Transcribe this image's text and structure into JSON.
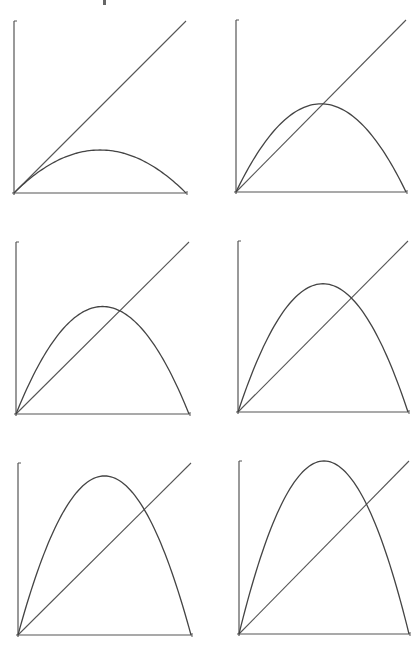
{
  "chart_data": [
    {
      "type": "line",
      "title": "",
      "description": "Parabola y = r·x·(1−x) vs identity line y = x",
      "r": 1.0,
      "xlim": [
        0,
        1
      ],
      "ylim": [
        0,
        1
      ],
      "grid": false,
      "series": [
        {
          "name": "parabola",
          "x": [
            0,
            0.25,
            0.5,
            0.75,
            1
          ],
          "values": [
            0,
            0.19,
            0.25,
            0.19,
            0
          ]
        },
        {
          "name": "identity",
          "x": [
            0,
            1
          ],
          "values": [
            0,
            1
          ]
        }
      ],
      "frame": {
        "x0": 14,
        "y0": 193,
        "x1": 186,
        "y1": 21
      }
    },
    {
      "type": "line",
      "title": "",
      "description": "Parabola y = r·x·(1−x) vs identity line y = x",
      "r": 2.05,
      "xlim": [
        0,
        1
      ],
      "ylim": [
        0,
        1
      ],
      "grid": false,
      "series": [
        {
          "name": "parabola",
          "x": [
            0,
            0.25,
            0.5,
            0.75,
            1
          ],
          "values": [
            0,
            0.38,
            0.51,
            0.38,
            0
          ]
        },
        {
          "name": "identity",
          "x": [
            0,
            1
          ],
          "values": [
            0,
            1
          ]
        }
      ],
      "frame": {
        "x0": 236,
        "y0": 192,
        "x1": 406,
        "y1": 20
      }
    },
    {
      "type": "line",
      "title": "",
      "description": "Parabola y = r·x·(1−x) vs identity line y = x",
      "r": 2.5,
      "xlim": [
        0,
        1
      ],
      "ylim": [
        0,
        1
      ],
      "grid": false,
      "series": [
        {
          "name": "parabola",
          "x": [
            0,
            0.25,
            0.5,
            0.75,
            1
          ],
          "values": [
            0,
            0.47,
            0.63,
            0.47,
            0
          ]
        },
        {
          "name": "identity",
          "x": [
            0,
            1
          ],
          "values": [
            0,
            1
          ]
        }
      ],
      "frame": {
        "x0": 16,
        "y0": 414,
        "x1": 189,
        "y1": 242
      }
    },
    {
      "type": "line",
      "title": "",
      "description": "Parabola y = r·x·(1−x) vs identity line y = x",
      "r": 3.0,
      "xlim": [
        0,
        1
      ],
      "ylim": [
        0,
        1
      ],
      "grid": false,
      "series": [
        {
          "name": "parabola",
          "x": [
            0,
            0.25,
            0.5,
            0.75,
            1
          ],
          "values": [
            0,
            0.56,
            0.75,
            0.56,
            0
          ]
        },
        {
          "name": "identity",
          "x": [
            0,
            1
          ],
          "values": [
            0,
            1
          ]
        }
      ],
      "frame": {
        "x0": 238,
        "y0": 412,
        "x1": 408,
        "y1": 241
      }
    },
    {
      "type": "line",
      "title": "",
      "description": "Parabola y = r·x·(1−x) vs identity line y = x",
      "r": 3.7,
      "xlim": [
        0,
        1
      ],
      "ylim": [
        0,
        1
      ],
      "grid": false,
      "series": [
        {
          "name": "parabola",
          "x": [
            0,
            0.25,
            0.5,
            0.75,
            1
          ],
          "values": [
            0,
            0.69,
            0.93,
            0.69,
            0
          ]
        },
        {
          "name": "identity",
          "x": [
            0,
            1
          ],
          "values": [
            0,
            1
          ]
        }
      ],
      "frame": {
        "x0": 18,
        "y0": 635,
        "x1": 191,
        "y1": 463
      }
    },
    {
      "type": "line",
      "title": "",
      "description": "Parabola y = r·x·(1−x) vs identity line y = x",
      "r": 4.0,
      "xlim": [
        0,
        1
      ],
      "ylim": [
        0,
        1
      ],
      "grid": false,
      "series": [
        {
          "name": "parabola",
          "x": [
            0,
            0.25,
            0.5,
            0.75,
            1
          ],
          "values": [
            0,
            0.75,
            1.0,
            0.75,
            0
          ]
        },
        {
          "name": "identity",
          "x": [
            0,
            1
          ],
          "values": [
            0,
            1
          ]
        }
      ],
      "frame": {
        "x0": 239,
        "y0": 634,
        "x1": 409,
        "y1": 461
      }
    }
  ],
  "style": {
    "axis_color": "#555555",
    "curve_color": "#444444",
    "background": "#ffffff"
  }
}
